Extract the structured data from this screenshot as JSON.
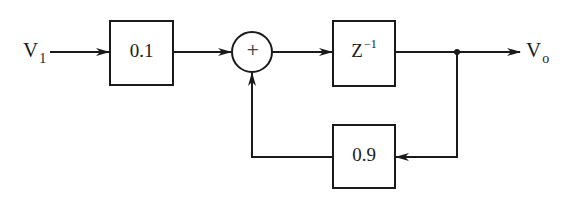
{
  "diagram": {
    "type": "block-diagram",
    "input": {
      "label": "V",
      "subscript": "1"
    },
    "output": {
      "label": "V",
      "subscript": "o"
    },
    "blocks": [
      {
        "id": "gain-input",
        "label": "0.1"
      },
      {
        "id": "delay",
        "label": "Z",
        "superscript": "−1"
      },
      {
        "id": "gain-feedback",
        "label": "0.9"
      }
    ],
    "summing_junction": {
      "symbol": "+"
    },
    "connections": [
      {
        "from": "V1",
        "to": "gain-input"
      },
      {
        "from": "gain-input",
        "to": "summing-junction"
      },
      {
        "from": "summing-junction",
        "to": "delay"
      },
      {
        "from": "delay",
        "to": "Vo"
      },
      {
        "from": "delay-output-node",
        "to": "gain-feedback"
      },
      {
        "from": "gain-feedback",
        "to": "summing-junction"
      }
    ],
    "colors": {
      "stroke": "#1a1a1a",
      "background": "#ffffff"
    }
  }
}
